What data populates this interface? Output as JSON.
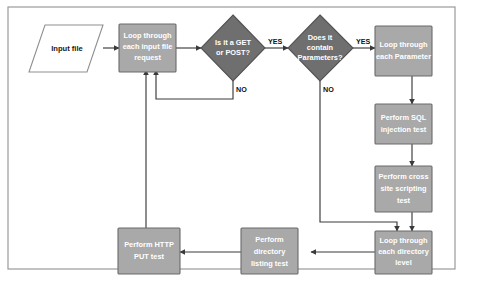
{
  "figure": {
    "name": "web-application-testing-flowchart",
    "frame": {
      "visible": true,
      "border_color": "#9a9a9a"
    },
    "colors": {
      "process_fill": "#a9a9a9",
      "process_stroke": "#6b6b6b",
      "decision_fill": "#6f6f6f",
      "decision_stroke": "#535353",
      "io_fill": "#ffffff",
      "io_stroke": "#8f8f8f",
      "line": "#3a3a3a",
      "node_text": "#ffffff",
      "io_text": "#1a1a1a",
      "background": "#ffffff"
    },
    "nodes": [
      {
        "id": "input-file",
        "type": "io",
        "label": "Input file",
        "lines": [
          "Input file"
        ]
      },
      {
        "id": "loop-input-file-request",
        "type": "process",
        "label": "Loop through each input file request",
        "lines": [
          "Loop through",
          "each input file",
          "request"
        ]
      },
      {
        "id": "is-get-or-post",
        "type": "decision",
        "label": "Is it a GET or POST?",
        "lines": [
          "Is it a GET",
          "or POST?"
        ]
      },
      {
        "id": "does-it-contain-parameters",
        "type": "decision",
        "label": "Does it contain Parameters?",
        "lines": [
          "Does it",
          "contain",
          "Parameters?"
        ]
      },
      {
        "id": "loop-each-parameter",
        "type": "process",
        "label": "Loop through each Parameter",
        "lines": [
          "Loop through",
          "each Parameter"
        ]
      },
      {
        "id": "perform-sql-injection-test",
        "type": "process",
        "label": "Perform SQL injection test",
        "lines": [
          "Perform SQL",
          "injection test"
        ]
      },
      {
        "id": "perform-cross-site-scripting-test",
        "type": "process",
        "label": "Perform cross site scripting test",
        "lines": [
          "Perform  cross",
          "site scripting",
          "test"
        ]
      },
      {
        "id": "loop-each-directory-level",
        "type": "process",
        "label": "Loop through each directory level",
        "lines": [
          "Loop through",
          "each directory",
          "level"
        ]
      },
      {
        "id": "perform-directory-listing-test",
        "type": "process",
        "label": "Perform directory listing test",
        "lines": [
          "Perform",
          "directory",
          "listing test"
        ]
      },
      {
        "id": "perform-http-put-test",
        "type": "process",
        "label": "Perform HTTP PUT test",
        "lines": [
          "Perform HTTP",
          "PUT test"
        ]
      }
    ],
    "branch_labels": [
      {
        "id": "get-post-yes",
        "text": "YES"
      },
      {
        "id": "get-post-no",
        "text": "NO"
      },
      {
        "id": "parameters-yes",
        "text": "YES"
      },
      {
        "id": "parameters-no",
        "text": "NO"
      }
    ],
    "edges": [
      {
        "from": "input-file",
        "to": "loop-input-file-request",
        "label": ""
      },
      {
        "from": "loop-input-file-request",
        "to": "is-get-or-post",
        "label": ""
      },
      {
        "from": "is-get-or-post",
        "to": "does-it-contain-parameters",
        "label": "YES"
      },
      {
        "from": "is-get-or-post",
        "to": "loop-input-file-request",
        "label": "NO"
      },
      {
        "from": "does-it-contain-parameters",
        "to": "loop-each-parameter",
        "label": "YES"
      },
      {
        "from": "does-it-contain-parameters",
        "to": "loop-each-directory-level",
        "label": "NO"
      },
      {
        "from": "loop-each-parameter",
        "to": "perform-sql-injection-test",
        "label": ""
      },
      {
        "from": "perform-sql-injection-test",
        "to": "perform-cross-site-scripting-test",
        "label": ""
      },
      {
        "from": "perform-cross-site-scripting-test",
        "to": "loop-each-directory-level",
        "label": ""
      },
      {
        "from": "loop-each-directory-level",
        "to": "perform-directory-listing-test",
        "label": ""
      },
      {
        "from": "perform-directory-listing-test",
        "to": "perform-http-put-test",
        "label": ""
      },
      {
        "from": "perform-http-put-test",
        "to": "loop-input-file-request",
        "label": ""
      }
    ]
  }
}
